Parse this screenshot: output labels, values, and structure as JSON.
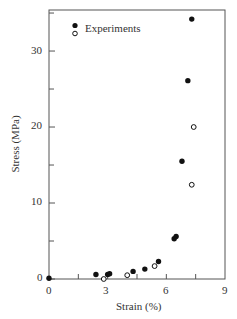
{
  "chart_data": {
    "type": "scatter",
    "title": "",
    "xlabel": "Strain (%)",
    "ylabel": "Stress (MPa)",
    "xlim": [
      0,
      9
    ],
    "ylim": [
      0,
      35.4
    ],
    "x_ticks": [
      0,
      3,
      6,
      9
    ],
    "y_ticks": [
      0,
      10,
      20,
      30
    ],
    "grid": false,
    "legend": {
      "position": "upper left",
      "label": "Experiments"
    },
    "series": [
      {
        "name": "Experiments (filled)",
        "marker": "filled-circle",
        "points": [
          [
            0,
            0.1
          ],
          [
            2.4,
            0.6
          ],
          [
            3.0,
            0.6
          ],
          [
            3.1,
            0.7
          ],
          [
            4.3,
            1.0
          ],
          [
            4.9,
            1.3
          ],
          [
            5.6,
            2.3
          ],
          [
            6.4,
            5.3
          ],
          [
            6.5,
            5.6
          ],
          [
            6.8,
            15.5
          ],
          [
            7.1,
            26.1
          ],
          [
            7.3,
            34.2
          ]
        ]
      },
      {
        "name": "Experiments (open)",
        "marker": "open-circle",
        "points": [
          [
            2.8,
            0.0
          ],
          [
            4.0,
            0.5
          ],
          [
            5.4,
            1.7
          ],
          [
            7.3,
            12.4
          ],
          [
            7.4,
            20.0
          ]
        ]
      }
    ]
  },
  "labels": {
    "xlabel": "Strain (%)",
    "ylabel": "Stress (MPa)",
    "legend": "Experiments",
    "xticks": [
      "0",
      "3",
      "6",
      "9"
    ],
    "yticks": [
      "0",
      "10",
      "20",
      "30"
    ]
  }
}
